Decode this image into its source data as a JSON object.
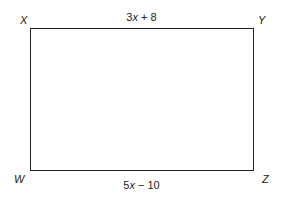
{
  "diagram": {
    "shape": "rectangle",
    "vertices": {
      "top_left": "X",
      "top_right": "Y",
      "bottom_left": "W",
      "bottom_right": "Z"
    },
    "sides": {
      "top": {
        "coef": "3",
        "var": "x",
        "rest": " + 8"
      },
      "bottom": {
        "coef": "5",
        "var": "x",
        "rest": " − 10"
      }
    }
  }
}
